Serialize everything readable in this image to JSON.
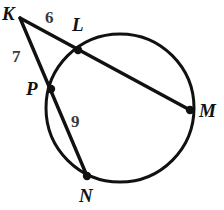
{
  "figure": {
    "kind": "circle-geometry-diagram",
    "stroke_color": "#111111",
    "label_color": "#121212",
    "measure_color": "#3a3a3a",
    "background_color": "#ffffff",
    "stroke_width": 3,
    "circle": {
      "center_x": 120,
      "center_y": 108,
      "radius": 74
    },
    "points": [
      {
        "id": "K",
        "label": "K",
        "x": 20,
        "y": 18,
        "on_circle": false,
        "dot": false,
        "label_x": 2,
        "label_y": 4
      },
      {
        "id": "L",
        "label": "L",
        "x": 78,
        "y": 50,
        "on_circle": true,
        "dot": true,
        "label_x": 72,
        "label_y": 15
      },
      {
        "id": "M",
        "label": "M",
        "x": 190,
        "y": 110,
        "on_circle": true,
        "dot": true,
        "label_x": 199,
        "label_y": 101
      },
      {
        "id": "P",
        "label": "P",
        "x": 51,
        "y": 89,
        "on_circle": true,
        "dot": true,
        "label_x": 26,
        "label_y": 79
      },
      {
        "id": "N",
        "label": "N",
        "x": 87,
        "y": 176,
        "on_circle": true,
        "dot": true,
        "label_x": 79,
        "label_y": 186
      }
    ],
    "segments": [
      {
        "id": "KLM",
        "from": "K",
        "to": "M",
        "through": "L",
        "type": "secant"
      },
      {
        "id": "KPN",
        "from": "K",
        "to": "N",
        "through": "P",
        "type": "secant"
      },
      {
        "id": "PN-chord",
        "from": "P",
        "to": "N",
        "type": "chord"
      }
    ],
    "measures": [
      {
        "id": "KL",
        "value": "6",
        "segment": "K to L",
        "x": 45,
        "y": 9
      },
      {
        "id": "KP",
        "value": "7",
        "segment": "K to P",
        "x": 12,
        "y": 48
      },
      {
        "id": "PN",
        "value": "9",
        "segment": "P to N",
        "x": 71,
        "y": 113
      }
    ]
  }
}
